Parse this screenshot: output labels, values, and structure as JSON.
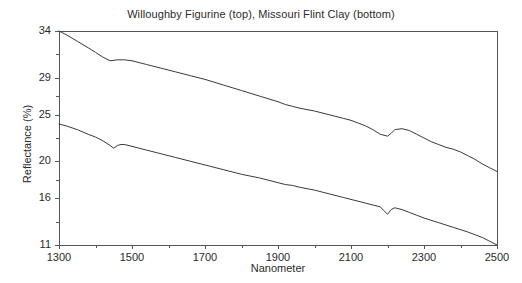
{
  "chart_data": {
    "type": "line",
    "title": "Willoughby Figurine (top), Missouri Flint Clay (bottom)",
    "xlabel": "Nanometer",
    "ylabel": "Reflectance (%)",
    "xlim": [
      1300,
      2500
    ],
    "ylim": [
      11,
      34
    ],
    "grid": false,
    "legend": "none (annotated in title)",
    "xticks": [
      1300,
      1500,
      1700,
      1900,
      2100,
      2300,
      2500
    ],
    "xtick_labels": [
      "1300",
      "1500",
      "1700",
      "1900",
      "2100",
      "2300",
      "2500"
    ],
    "yticks": [
      11,
      16,
      20,
      25,
      29,
      34
    ],
    "ytick_labels": [
      "11",
      "16",
      "20",
      "25",
      "29",
      "34"
    ],
    "minor_xticks": [
      1400,
      1600,
      1800,
      2000,
      2200,
      2400
    ],
    "minor_yticks": [
      13.5,
      18,
      22.5,
      27,
      31.5
    ],
    "line_color": "#3a3a3a",
    "line_width": 1,
    "series": [
      {
        "name": "Willoughby Figurine (top)",
        "x": [
          1300,
          1320,
          1350,
          1380,
          1400,
          1420,
          1440,
          1460,
          1480,
          1500,
          1540,
          1580,
          1620,
          1660,
          1700,
          1750,
          1800,
          1850,
          1900,
          1920,
          1940,
          1960,
          2000,
          2040,
          2080,
          2100,
          2120,
          2140,
          2160,
          2180,
          2200,
          2210,
          2220,
          2240,
          2260,
          2280,
          2300,
          2320,
          2340,
          2360,
          2380,
          2400,
          2420,
          2440,
          2460,
          2480,
          2500
        ],
        "y": [
          34.0,
          33.6,
          32.9,
          32.2,
          31.7,
          31.2,
          30.8,
          30.9,
          30.9,
          30.8,
          30.4,
          30.0,
          29.6,
          29.2,
          28.8,
          28.2,
          27.6,
          27.0,
          26.4,
          26.1,
          25.9,
          25.7,
          25.4,
          25.0,
          24.6,
          24.4,
          24.1,
          23.8,
          23.4,
          22.9,
          22.7,
          23.0,
          23.4,
          23.5,
          23.3,
          22.9,
          22.5,
          22.1,
          21.8,
          21.5,
          21.3,
          21.0,
          20.6,
          20.2,
          19.7,
          19.3,
          18.9
        ]
      },
      {
        "name": "Missouri Flint Clay (bottom)",
        "x": [
          1300,
          1320,
          1350,
          1380,
          1400,
          1420,
          1440,
          1450,
          1460,
          1470,
          1480,
          1500,
          1540,
          1580,
          1620,
          1660,
          1700,
          1750,
          1800,
          1850,
          1900,
          1920,
          1940,
          1960,
          2000,
          2040,
          2080,
          2100,
          2140,
          2160,
          2180,
          2190,
          2200,
          2210,
          2220,
          2240,
          2260,
          2280,
          2300,
          2340,
          2380,
          2420,
          2440,
          2460,
          2480,
          2500
        ],
        "y": [
          24.0,
          23.8,
          23.4,
          22.9,
          22.6,
          22.2,
          21.7,
          21.4,
          21.7,
          21.8,
          21.8,
          21.6,
          21.2,
          20.8,
          20.4,
          20.0,
          19.6,
          19.1,
          18.6,
          18.2,
          17.7,
          17.5,
          17.4,
          17.2,
          16.9,
          16.5,
          16.1,
          15.9,
          15.5,
          15.3,
          15.1,
          14.7,
          14.3,
          14.8,
          15.0,
          14.8,
          14.5,
          14.2,
          13.9,
          13.4,
          12.9,
          12.4,
          12.1,
          11.8,
          11.4,
          11.0
        ]
      }
    ]
  },
  "axes": {
    "frame_color": "#555555"
  }
}
